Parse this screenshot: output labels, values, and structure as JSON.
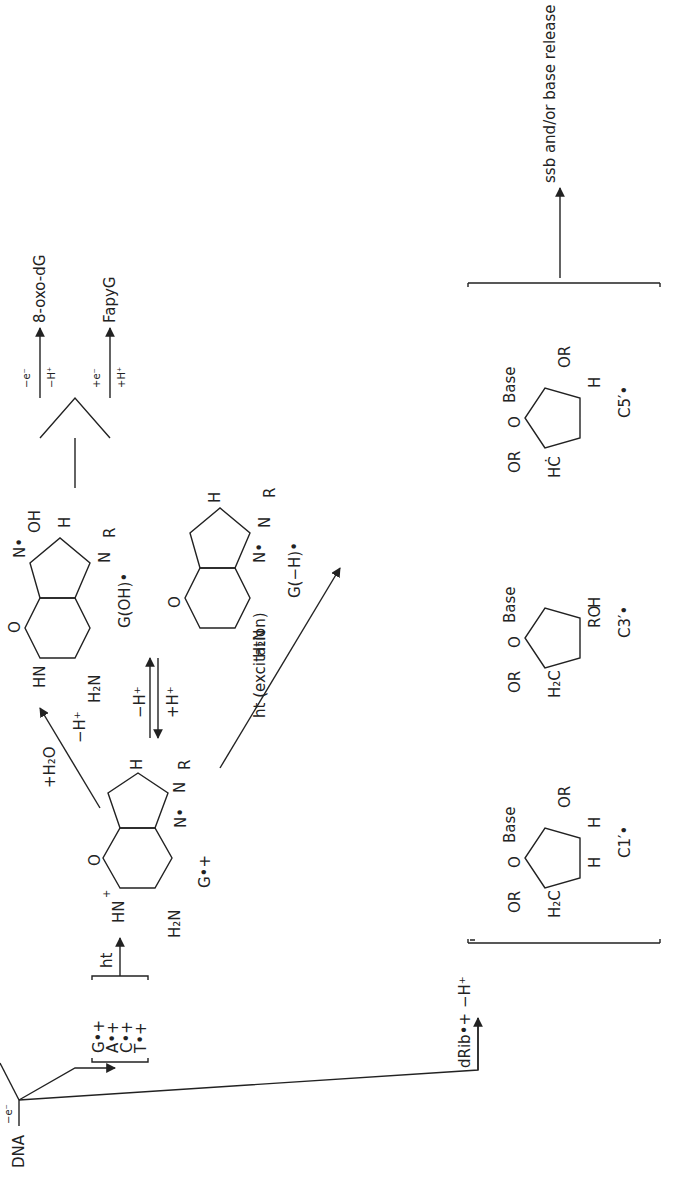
{
  "diagram": {
    "start": {
      "label": "DNA",
      "step": "−e⁻"
    },
    "branch_base": {
      "cations": [
        "G•+",
        "A•+",
        "C•+",
        "T•+"
      ],
      "transfer_label": "ht",
      "guanine_cation": {
        "label": "G•+",
        "atoms": [
          "HN",
          "+",
          "O",
          "N",
          "N",
          "H",
          "N",
          "R",
          "N",
          "H₂N",
          "•"
        ]
      },
      "hydration": {
        "reagent": "+H₂O",
        "step": "−H⁺"
      },
      "goh": {
        "label": "G(OH)•",
        "atoms": [
          "HN",
          "O",
          "N",
          "N•",
          "OH",
          "H",
          "N",
          "R",
          "H₂N"
        ]
      },
      "equilibrium": {
        "forward": "−H⁺",
        "reverse": "+H⁺"
      },
      "deprotonated": {
        "label": "G(−H)•",
        "atoms": [
          "O",
          "N",
          "N",
          "H",
          "N",
          "R",
          "N•",
          "H₂N"
        ]
      },
      "products": [
        {
          "label": "8-oxo-dG",
          "conditions": [
            "−e⁻",
            "−H⁺"
          ]
        },
        {
          "label": "FapyG",
          "conditions": [
            "+e⁻",
            "+H⁺"
          ]
        }
      ],
      "excitation": "ht (excitation)"
    },
    "branch_sugar": {
      "cation": "dRib•+",
      "step": "−H⁺",
      "radicals": [
        {
          "label": "C1′•",
          "sub": [
            "OR",
            "H₂C",
            "O",
            "Base",
            "H",
            "H",
            "H",
            "OR",
            "H"
          ]
        },
        {
          "label": "C3′•",
          "sub": [
            "OR",
            "H₂C",
            "O",
            "Base",
            "H",
            "H",
            "H",
            "RO",
            "H"
          ]
        },
        {
          "label": "C5′•",
          "sub": [
            "OR",
            "HĊ",
            "O",
            "Base",
            "H",
            "H",
            "H",
            "OR",
            "H"
          ]
        }
      ],
      "outcome": "ssb and/or base release"
    }
  }
}
